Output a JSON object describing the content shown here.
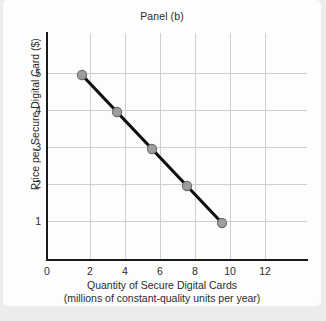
{
  "chart_data": {
    "type": "line",
    "title": "Panel (b)",
    "xlabel": "Quantity of Secure Digital Cards",
    "xlabel_line2": "(millions of constant-quality units per year)",
    "ylabel": "Price per Secure Digital Card ($)",
    "x": [
      2,
      4,
      6,
      8,
      10
    ],
    "values": [
      5,
      4,
      3,
      2,
      1
    ],
    "series": [
      {
        "name": "Demand",
        "x": [
          2,
          4,
          6,
          8,
          10
        ],
        "values": [
          5,
          4,
          3,
          2,
          1
        ]
      }
    ],
    "xlim": [
      0,
      14.75
    ],
    "ylim": [
      0,
      6.15
    ],
    "xticks": [
      0,
      2,
      4,
      6,
      8,
      10,
      12
    ],
    "yticks": [
      1,
      2,
      3,
      4,
      5
    ],
    "xtick_labels": [
      "0",
      "2",
      "4",
      "6",
      "8",
      "10",
      "12"
    ],
    "ytick_labels": [
      "1",
      "2",
      "3",
      "4",
      "5"
    ],
    "grid": true,
    "legend": false,
    "line_color": "#101010",
    "marker_fill": "#9d9d9d",
    "marker_edge": "#6e6e6e",
    "grid_color": "#cfcfcf",
    "axis_color": "#1a1a1a",
    "background": "#fdfdfd",
    "page_background": "#ececed"
  }
}
